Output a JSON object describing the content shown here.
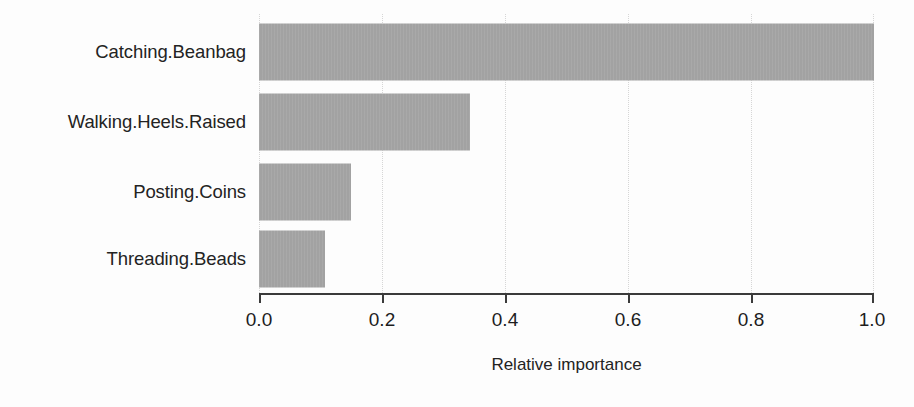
{
  "chart_data": {
    "type": "bar",
    "orientation": "horizontal",
    "title": "",
    "subtitle": "",
    "xlabel": "Relative importance",
    "ylabel": "",
    "categories": [
      "Catching.Beanbag",
      "Walking.Heels.Raised",
      "Posting.Coins",
      "Threading.Beads"
    ],
    "values": [
      1.0,
      0.343,
      0.15,
      0.107
    ],
    "xlim": [
      0.0,
      1.0
    ],
    "xticks": [
      0.0,
      0.2,
      0.4,
      0.6,
      0.8,
      1.0
    ],
    "xticklabels": [
      "0.0",
      "0.2",
      "0.4",
      "0.6",
      "0.8",
      "1.0"
    ],
    "grid": "vertical-dotted",
    "legend": "none",
    "bar_color": "#a5a5a5",
    "axis_color": "#3b3b3b",
    "text_color": "#232323",
    "background_color": "#fdfdfd"
  },
  "axis": {
    "x_title": "Relative importance"
  }
}
